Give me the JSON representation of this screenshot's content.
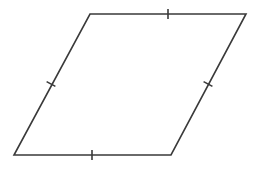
{
  "diagram": {
    "type": "rhombus",
    "stroke_color": "#3a3a3a",
    "stroke_width": 1.6,
    "background": "#ffffff",
    "vertices": [
      {
        "name": "top-left",
        "x": 90,
        "y": 14
      },
      {
        "name": "top-right",
        "x": 246,
        "y": 14
      },
      {
        "name": "bottom-right",
        "x": 171,
        "y": 155
      },
      {
        "name": "bottom-left",
        "x": 14,
        "y": 155
      }
    ],
    "congruence_marks": [
      {
        "side": "top",
        "x": 168,
        "y": 14,
        "ticks": 1
      },
      {
        "side": "right",
        "x": 208,
        "y": 84,
        "ticks": 1
      },
      {
        "side": "bottom",
        "x": 92,
        "y": 155,
        "ticks": 1
      },
      {
        "side": "left",
        "x": 51,
        "y": 84,
        "ticks": 1
      }
    ]
  }
}
